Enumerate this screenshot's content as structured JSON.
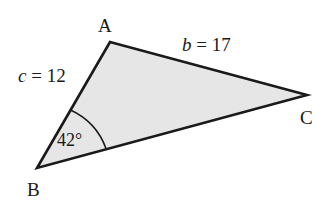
{
  "diagram": {
    "type": "triangle",
    "fill_color": "#e6e6e6",
    "stroke_color": "#1a1a1a",
    "vertices": {
      "A": {
        "label": "A",
        "x": 110,
        "y": 42
      },
      "B": {
        "label": "B",
        "x": 37,
        "y": 168
      },
      "C": {
        "label": "C",
        "x": 307,
        "y": 95
      }
    },
    "sides": {
      "c": {
        "label": "c = 12",
        "var": "c",
        "eq": " = 12"
      },
      "b": {
        "label": "b = 17",
        "var": "b",
        "eq": " = 17"
      }
    },
    "angle_B": {
      "label": "42°"
    }
  }
}
